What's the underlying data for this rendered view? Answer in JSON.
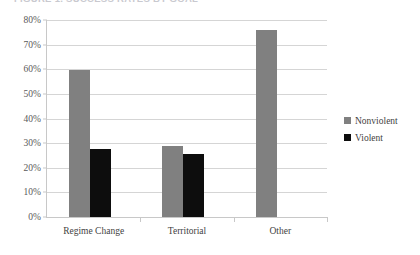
{
  "chart_data": {
    "type": "bar",
    "title": "FIGURE 1. SUCCESS RATES BY GOAL",
    "xlabel": "",
    "ylabel": "",
    "categories": [
      "Regime Change",
      "Territorial",
      "Other"
    ],
    "series": [
      {
        "name": "Nonviolent",
        "color": "#808080",
        "values": [
          59.8,
          29.0,
          76.0
        ]
      },
      {
        "name": "Violent",
        "color": "#0d0d0d",
        "values": [
          27.5,
          25.5,
          null
        ]
      }
    ],
    "ylim": [
      0,
      80
    ],
    "ytick_values": [
      0,
      10,
      20,
      30,
      40,
      50,
      60,
      70,
      80
    ],
    "ytick_labels": [
      "0%",
      "10%",
      "20%",
      "30%",
      "40%",
      "50%",
      "60%",
      "70%",
      "80%"
    ],
    "grid": true,
    "legend_position": "right"
  },
  "colors": {
    "nonviolent": "#808080",
    "violent": "#0d0d0d",
    "gridline": "#d5d5d5",
    "axis": "#c8c8c8",
    "background": "#ffffff"
  }
}
